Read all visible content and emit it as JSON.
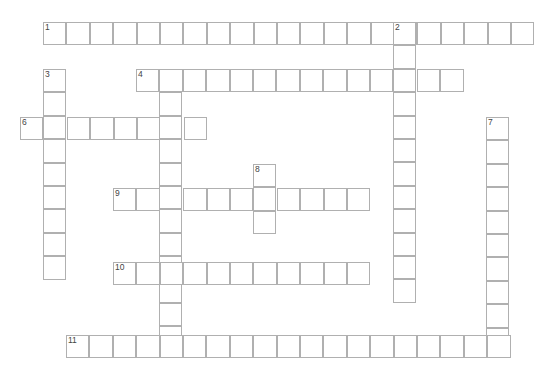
{
  "header": {
    "fragment_text": ""
  },
  "grid": {
    "cell_size": 23.4,
    "border_color": "#b0b0b0",
    "number_color": "#444444"
  },
  "words": [
    {
      "number": "1",
      "direction": "across",
      "x": 43,
      "y": 22,
      "length": 21
    },
    {
      "number": "2",
      "direction": "down",
      "x": 393,
      "y": 22,
      "length": 12
    },
    {
      "number": "3",
      "direction": "down",
      "x": 43,
      "y": 69,
      "length": 9
    },
    {
      "number": "4",
      "direction": "across",
      "x": 136,
      "y": 69,
      "length": 14
    },
    {
      "number": "5",
      "direction": "down",
      "x": 159,
      "y": 69,
      "length": 12
    },
    {
      "number": "6",
      "direction": "across",
      "x": 20,
      "y": 117,
      "length": 8
    },
    {
      "number": "7",
      "direction": "down",
      "x": 486,
      "y": 117,
      "length": 10
    },
    {
      "number": "8",
      "direction": "down",
      "x": 253,
      "y": 164,
      "length": 3
    },
    {
      "number": "9",
      "direction": "across",
      "x": 113,
      "y": 188,
      "length": 11
    },
    {
      "number": "10",
      "direction": "across",
      "x": 113,
      "y": 262,
      "length": 11
    },
    {
      "number": "11",
      "direction": "across",
      "x": 66,
      "y": 335,
      "length": 19
    }
  ]
}
